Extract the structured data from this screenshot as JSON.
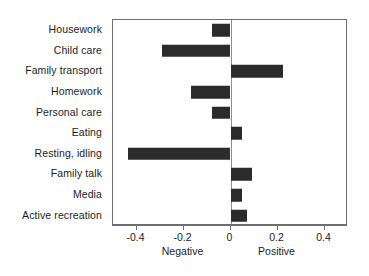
{
  "chart_data": {
    "type": "bar",
    "orientation": "horizontal",
    "title": "",
    "subtitle": "",
    "xlabel": "",
    "ylabel": "",
    "xlim": [
      -0.5,
      0.5
    ],
    "xticks": [
      -0.4,
      -0.2,
      0,
      0.2,
      0.4
    ],
    "xticklabels": [
      "-0.4",
      "-0.2",
      "0",
      "0.2",
      "0.4"
    ],
    "grid": false,
    "legend": null,
    "axis_side_labels": {
      "negative": "Negative",
      "positive": "Positive"
    },
    "bar_color": "#2b2b2b",
    "frame_color": "#6e6e6e",
    "categories": [
      "Housework",
      "Child care",
      "Family transport",
      "Homework",
      "Personal care",
      "Eating",
      "Resting, idling",
      "Family talk",
      "Media",
      "Active recreation"
    ],
    "values": [
      -0.078,
      -0.29,
      0.225,
      -0.17,
      -0.078,
      0.05,
      -0.435,
      0.09,
      0.05,
      0.07
    ]
  }
}
